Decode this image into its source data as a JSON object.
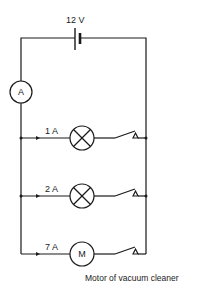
{
  "diagram": {
    "type": "parallel-circuit",
    "supply": {
      "label": "12 V",
      "component": "battery-cell"
    },
    "ammeter": {
      "symbol": "A"
    },
    "branches": [
      {
        "current_label": "1 A",
        "component": "lamp",
        "switch": "open"
      },
      {
        "current_label": "2 A",
        "component": "lamp",
        "switch": "open"
      },
      {
        "current_label": "7 A",
        "component": "motor",
        "symbol": "M",
        "switch": "open"
      }
    ],
    "caption": "Motor of vacuum cleaner",
    "colors": {
      "line": "#1a1a1a",
      "background": "#ffffff"
    }
  }
}
